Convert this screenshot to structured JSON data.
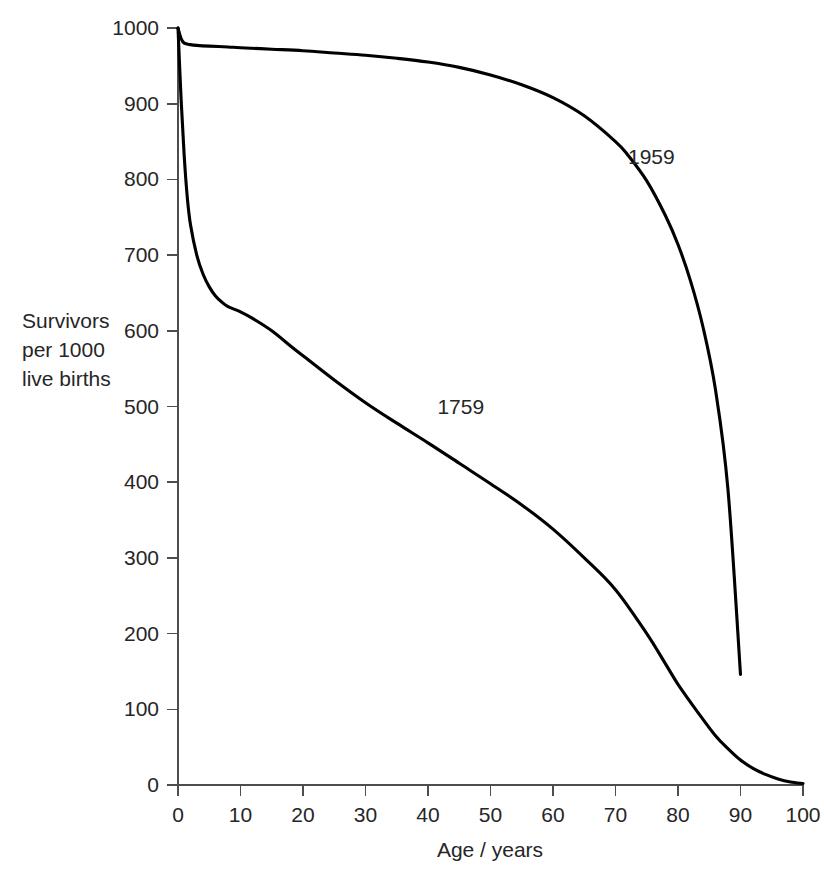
{
  "chart_data": {
    "type": "line",
    "title": "",
    "xlabel": "Age / years",
    "ylabel": "Survivors per 1000 live births",
    "ylabel_lines": [
      "Survivors",
      "per 1000",
      "live births"
    ],
    "xlim": [
      0,
      100
    ],
    "ylim": [
      0,
      1000
    ],
    "xticks": [
      0,
      10,
      20,
      30,
      40,
      50,
      60,
      70,
      80,
      90,
      100
    ],
    "xtick_labels": [
      "0",
      "10",
      "20",
      "30",
      "40",
      "50",
      "60",
      "70",
      "80",
      "90",
      "100"
    ],
    "yticks": [
      0,
      100,
      200,
      300,
      400,
      500,
      600,
      700,
      800,
      900,
      1000
    ],
    "ytick_labels": [
      "0",
      "100",
      "200",
      "300",
      "400",
      "500",
      "600",
      "700",
      "800",
      "900",
      "1000"
    ],
    "grid": false,
    "legend_position": "inline-annotations",
    "line_color": "#000000",
    "axis_color": "#4d4d4d",
    "background_color": "#ffffff",
    "series": [
      {
        "name": "1959",
        "label": "1959",
        "label_x": 72,
        "label_y": 820,
        "x": [
          0,
          0.5,
          1,
          2,
          3,
          5,
          8,
          10,
          15,
          20,
          25,
          30,
          35,
          40,
          45,
          50,
          55,
          60,
          65,
          70,
          72,
          75,
          78,
          80,
          82,
          84,
          86,
          88,
          90
        ],
        "values": [
          1000,
          986,
          980,
          978,
          977,
          976,
          975,
          974,
          972,
          970,
          967,
          964,
          960,
          955,
          948,
          938,
          925,
          908,
          884,
          850,
          832,
          798,
          752,
          714,
          666,
          605,
          522,
          390,
          146
        ]
      },
      {
        "name": "1759",
        "label": "1759",
        "label_x": 41.5,
        "label_y": 490,
        "x": [
          0,
          0.5,
          1,
          1.5,
          2,
          3,
          4,
          5,
          6,
          7,
          8,
          10,
          12,
          15,
          18,
          20,
          25,
          30,
          35,
          40,
          45,
          50,
          55,
          60,
          65,
          70,
          75,
          78,
          80,
          83,
          86,
          88,
          90,
          92,
          94,
          96,
          98,
          100
        ],
        "values": [
          1000,
          905,
          830,
          775,
          740,
          700,
          675,
          658,
          646,
          638,
          632,
          625,
          616,
          600,
          580,
          567,
          535,
          505,
          478,
          452,
          425,
          398,
          370,
          338,
          300,
          258,
          200,
          160,
          133,
          98,
          65,
          48,
          33,
          22,
          14,
          8,
          4,
          2
        ]
      }
    ]
  },
  "plot_geometry": {
    "left": 178,
    "right": 803,
    "top": 28,
    "bottom": 785
  }
}
